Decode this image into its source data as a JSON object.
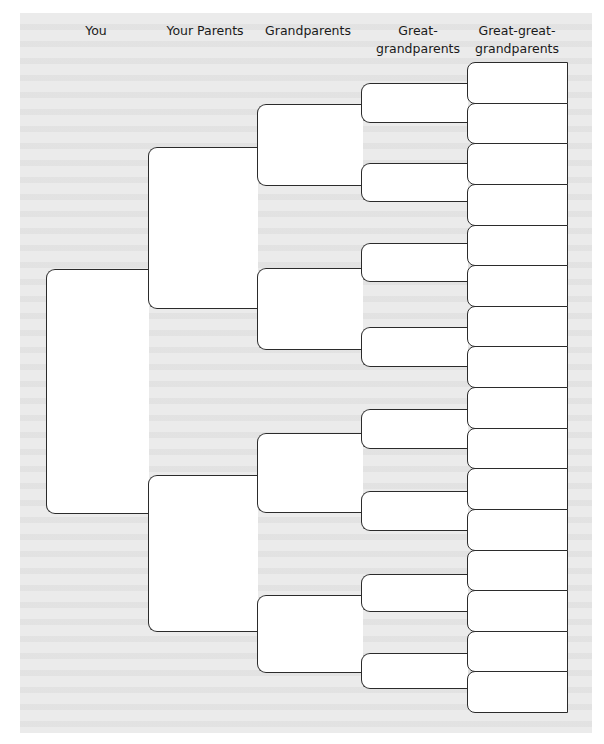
{
  "chart": {
    "headers": [
      {
        "label": "You",
        "cx": 96
      },
      {
        "label": "Your Parents",
        "cx": 205
      },
      {
        "label": "Grandparents",
        "cx": 308
      },
      {
        "label": "Great-\ngrandparents",
        "line1": "Great-",
        "line2": "grandparents",
        "cx": 418
      },
      {
        "label": "Great-great-\ngrandparents",
        "line1": "Great-great-",
        "line2": "grandparents",
        "cx": 517
      }
    ],
    "generations": {
      "you": [
        {
          "top": 269,
          "bottom": 514
        }
      ],
      "parents": [
        {
          "top": 147,
          "bottom": 309
        },
        {
          "top": 475,
          "bottom": 632
        }
      ],
      "grandparents": [
        {
          "top": 104,
          "bottom": 186
        },
        {
          "top": 268,
          "bottom": 350
        },
        {
          "top": 433,
          "bottom": 513
        },
        {
          "top": 595,
          "bottom": 673
        }
      ],
      "great_grandparents": [
        {
          "top": 83,
          "bottom": 123
        },
        {
          "top": 163,
          "bottom": 202
        },
        {
          "top": 243,
          "bottom": 282
        },
        {
          "top": 327,
          "bottom": 367
        },
        {
          "top": 409,
          "bottom": 449
        },
        {
          "top": 491,
          "bottom": 531
        },
        {
          "top": 574,
          "bottom": 612
        },
        {
          "top": 653,
          "bottom": 689
        }
      ],
      "great_great_grandparents_count": 16
    },
    "colors": {
      "line": "#2b2b2b",
      "box_fill": "#ffffff",
      "paper": "#ebebeb"
    }
  }
}
